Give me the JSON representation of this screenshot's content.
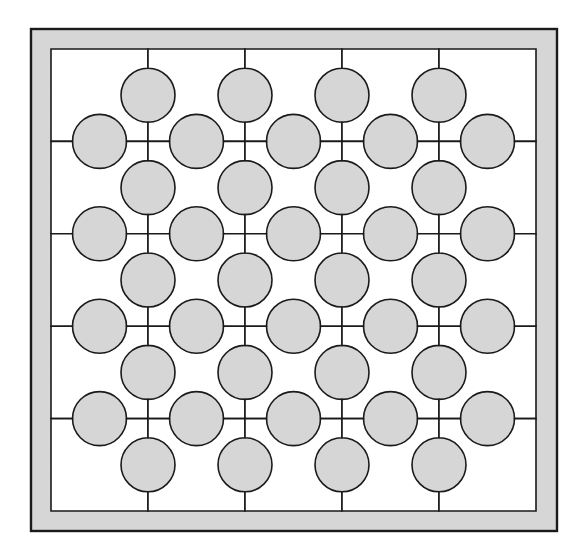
{
  "figure": {
    "title": "Perforated square-tile lattice pattern",
    "kind": "geometric-pattern"
  },
  "canvas": {
    "width": 587,
    "height": 556,
    "background_color": "#ffffff"
  },
  "frame": {
    "name": "outer-frame",
    "x": 31,
    "y": 29,
    "width": 526,
    "height": 502,
    "fill_color": "#d6d6d6",
    "stroke_color": "#1a1a1a",
    "stroke_width": 2.4
  },
  "grid": {
    "name": "tile-grid",
    "columns": 5,
    "rows": 5,
    "origin_x": 51,
    "origin_y": 49,
    "cell_width": 97,
    "cell_height": 92.4,
    "tile_fill_color": "#ffffff",
    "tile_stroke_color": "#1a1a1a",
    "tile_stroke_width": 1.6,
    "bite_radius": 27,
    "bite_edges": "interior-only",
    "column_labels": [
      "c1",
      "c2",
      "c3",
      "c4",
      "c5"
    ],
    "row_labels": [
      "r1",
      "r2",
      "r3",
      "r4",
      "r5"
    ]
  },
  "chart_data": {
    "type": "heatmap",
    "title": "Perforated square-tile lattice pattern",
    "xlabel": "",
    "ylabel": "",
    "categories": [
      "c1",
      "c2",
      "c3",
      "c4",
      "c5"
    ],
    "rows": [
      "r1",
      "r2",
      "r3",
      "r4",
      "r5"
    ],
    "grid": true,
    "legend": "none",
    "values": [
      [
        1,
        1,
        1,
        1,
        1
      ],
      [
        1,
        1,
        1,
        1,
        1
      ],
      [
        1,
        1,
        1,
        1,
        1
      ],
      [
        1,
        1,
        1,
        1,
        1
      ],
      [
        1,
        1,
        1,
        1,
        1
      ]
    ]
  },
  "colors": {
    "gray_field": "#d6d6d6",
    "tile_white": "#ffffff",
    "ink": "#1a1a1a",
    "page_white": "#ffffff"
  }
}
